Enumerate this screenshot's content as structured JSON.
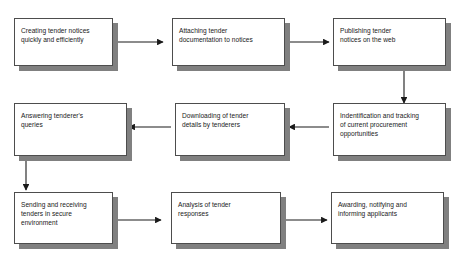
{
  "diagram": {
    "type": "flowchart",
    "layout": "serpentine-grid-3x3",
    "flow_description": "Row 1 flows left to right, row 2 flows right to left, row 3 flows left to right",
    "background_color": "#ffffff",
    "box_fill_color": "#ffffff",
    "box_border_color": "#4d4d4d",
    "box_shadow_color": "#808080",
    "connector_color": "#1a1a1a",
    "text_color": "#1a1a1a",
    "nodes": [
      {
        "id": "n1",
        "text": "Creating tender notices\nquickly and efficiently"
      },
      {
        "id": "n2",
        "text": "Attaching tender\ndocumentation to notices"
      },
      {
        "id": "n3",
        "text": "Publishing tender\nnotices on the web"
      },
      {
        "id": "n4",
        "text": "Answering tenderer's\nqueries"
      },
      {
        "id": "n5",
        "text": "Downloading of tender\ndetails by tenderers"
      },
      {
        "id": "n6",
        "text": "Indentification and tracking\nof current procurement\nopportunities"
      },
      {
        "id": "n7",
        "text": "Sending and receiving\ntenders in secure\nenvironment"
      },
      {
        "id": "n8",
        "text": "Analysis of tender\nresponses"
      },
      {
        "id": "n9",
        "text": "Awarding, notifying and\ninforming applicants"
      }
    ],
    "connectors": [
      {
        "id": "c1",
        "from": "n1",
        "to": "n2",
        "direction": "right"
      },
      {
        "id": "c2",
        "from": "n2",
        "to": "n3",
        "direction": "right"
      },
      {
        "id": "c3",
        "from": "n3",
        "to": "n6",
        "direction": "down"
      },
      {
        "id": "c4",
        "from": "n6",
        "to": "n5",
        "direction": "left"
      },
      {
        "id": "c5",
        "from": "n5",
        "to": "n4",
        "direction": "left"
      },
      {
        "id": "c6",
        "from": "n4",
        "to": "n7",
        "direction": "down"
      },
      {
        "id": "c7",
        "from": "n7",
        "to": "n8",
        "direction": "right"
      },
      {
        "id": "c8",
        "from": "n8",
        "to": "n9",
        "direction": "right"
      }
    ]
  }
}
